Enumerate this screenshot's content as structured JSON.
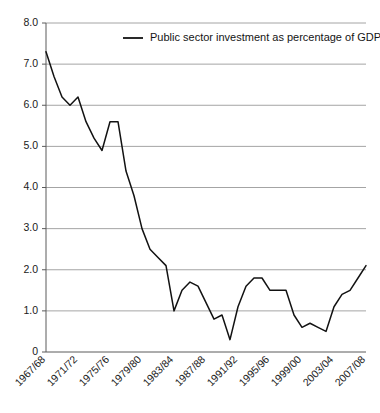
{
  "chart_data": {
    "type": "line",
    "title": "",
    "xlabel": "",
    "ylabel": "",
    "ylim": [
      0,
      8.0
    ],
    "grid": true,
    "legend_position": "top-center",
    "yticks": [
      "0",
      "1.0",
      "2.0",
      "3.0",
      "4.0",
      "5.0",
      "6.0",
      "7.0",
      "8.0"
    ],
    "ytick_values": [
      0,
      1.0,
      2.0,
      3.0,
      4.0,
      5.0,
      6.0,
      7.0,
      8.0
    ],
    "xtick_labels": [
      "1967/68",
      "1971/72",
      "1975/76",
      "1979/80",
      "1983/84",
      "1987/88",
      "1991/92",
      "1995/96",
      "1999/00",
      "2003/04",
      "2007/08"
    ],
    "xtick_indices": [
      0,
      4,
      8,
      12,
      16,
      20,
      24,
      28,
      32,
      36,
      40
    ],
    "categories": [
      "1967/68",
      "1968/69",
      "1969/70",
      "1970/71",
      "1971/72",
      "1972/73",
      "1973/74",
      "1974/75",
      "1975/76",
      "1976/77",
      "1977/78",
      "1978/79",
      "1979/80",
      "1980/81",
      "1981/82",
      "1982/83",
      "1983/84",
      "1984/85",
      "1985/86",
      "1986/87",
      "1987/88",
      "1988/89",
      "1989/90",
      "1990/91",
      "1991/92",
      "1992/93",
      "1993/94",
      "1994/95",
      "1995/96",
      "1996/97",
      "1997/98",
      "1998/99",
      "1999/00",
      "2000/01",
      "2001/02",
      "2002/03",
      "2003/04",
      "2004/05",
      "2005/06",
      "2006/07",
      "2007/08"
    ],
    "series": [
      {
        "name": "Public sector investment as percentage of GDP",
        "color": "#121212",
        "values": [
          7.3,
          6.7,
          6.2,
          6.0,
          6.2,
          5.6,
          5.2,
          4.9,
          5.6,
          5.6,
          4.4,
          3.8,
          3.0,
          2.5,
          2.3,
          2.1,
          1.0,
          1.5,
          1.7,
          1.6,
          1.2,
          0.8,
          0.9,
          0.3,
          1.1,
          1.6,
          1.8,
          1.8,
          1.5,
          1.5,
          1.5,
          0.9,
          0.6,
          0.7,
          0.6,
          0.5,
          1.1,
          1.4,
          1.5,
          1.8,
          2.1
        ]
      }
    ]
  },
  "legend": {
    "entries": [
      {
        "label": "Public sector investment as percentage of GDP",
        "color": "#121212"
      }
    ]
  }
}
